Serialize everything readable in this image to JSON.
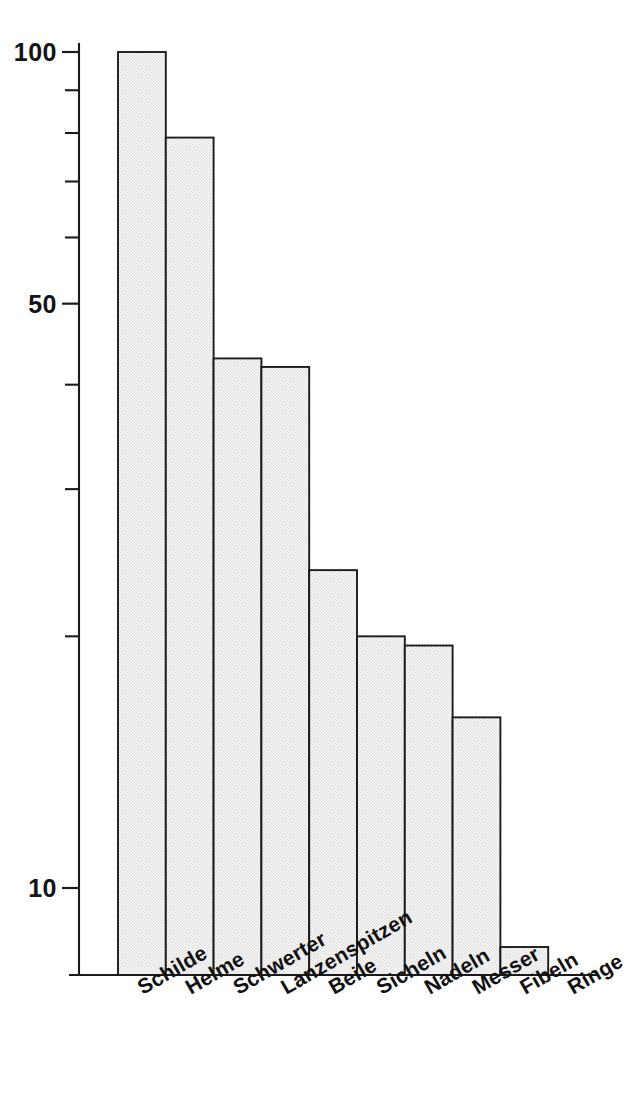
{
  "chart_data": {
    "type": "bar",
    "title": "",
    "subtitle": "",
    "xlabel": "",
    "ylabel": "",
    "scale": "log",
    "grid": false,
    "legend": "none",
    "ylim": [
      5,
      100
    ],
    "categories": [
      "Schilde",
      "Helme",
      "Schwerter",
      "Lanzenspitzen",
      "Beile",
      "Sicheln",
      "Nadeln",
      "Messer",
      "Fibeln",
      "Ringe"
    ],
    "values": [
      100,
      79,
      43,
      42,
      24,
      20,
      19.5,
      16,
      8.5,
      6.5
    ],
    "y_tick_labels": [
      "100",
      "50",
      "10"
    ],
    "y_labeled_ticks": [
      100,
      50,
      10
    ],
    "y_minor_ticks": [
      90,
      80,
      70,
      60,
      40,
      30,
      20
    ],
    "bar_fill_color": "#f2f2f2",
    "bar_edge_color": "#1b1b1b",
    "axis_color": "#1b1b1b",
    "background_color": "#ffffff",
    "xtick_label_rotation_deg": -30
  },
  "axis": {
    "y_ticks": [
      {
        "value": 100,
        "label": "100",
        "major": true
      },
      {
        "value": 90,
        "label": "",
        "major": false
      },
      {
        "value": 80,
        "label": "",
        "major": false
      },
      {
        "value": 70,
        "label": "",
        "major": false
      },
      {
        "value": 60,
        "label": "",
        "major": false
      },
      {
        "value": 50,
        "label": "50",
        "major": true
      },
      {
        "value": 40,
        "label": "",
        "major": false
      },
      {
        "value": 30,
        "label": "",
        "major": false
      },
      {
        "value": 20,
        "label": "",
        "major": false
      },
      {
        "value": 10,
        "label": "10",
        "major": true
      }
    ]
  }
}
